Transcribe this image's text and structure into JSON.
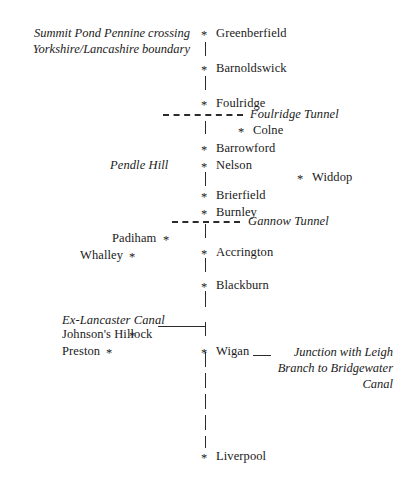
{
  "diagram": {
    "marker_glyph": "*",
    "ink_color": "#1a1a1a",
    "background_color": "#ffffff"
  },
  "captions": {
    "summit_line1": "Summit Pond Pennine crossing",
    "summit_line2": "Yorkshire/Lancashire boundary"
  },
  "main_line": [
    {
      "name": "Greenberfield"
    },
    {
      "name": "Barnoldswick"
    },
    {
      "name": "Foulridge"
    },
    {
      "name": "Colne"
    },
    {
      "name": "Barrowford"
    },
    {
      "name": "Nelson"
    },
    {
      "name": "Brierfield"
    },
    {
      "name": "Burnley"
    },
    {
      "name": "Accrington"
    },
    {
      "name": "Blackburn"
    },
    {
      "name": "Wigan"
    },
    {
      "name": "Liverpool"
    }
  ],
  "branch_places": [
    {
      "name": "Widdop"
    },
    {
      "name": "Padiham"
    },
    {
      "name": "Whalley"
    },
    {
      "name": "Johnson's Hillock"
    },
    {
      "name": "Preston"
    }
  ],
  "tunnels": [
    {
      "label": "Foulridge Tunnel"
    },
    {
      "label": "Gannow Tunnel"
    }
  ],
  "landmarks": [
    {
      "label": "Pendle Hill"
    },
    {
      "label": "Ex-Lancaster Canal"
    }
  ],
  "junction_note": {
    "line1": "Junction with Leigh",
    "line2": "Branch to Bridgewater",
    "line3": "Canal"
  }
}
